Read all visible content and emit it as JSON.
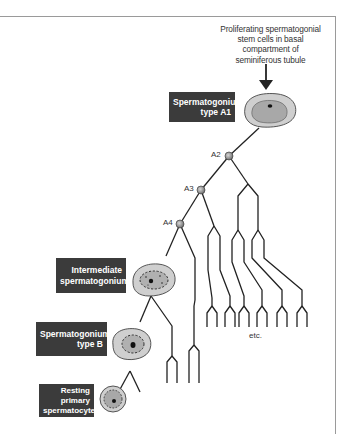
{
  "caption": {
    "lines": [
      "Proliferating spermatogonial",
      "stem cells in basal",
      "compartment of",
      "seminiferous tubule"
    ]
  },
  "labels": {
    "a1": [
      "Spermatogonium",
      "type A1"
    ],
    "intermediate": [
      "Intermediate",
      "spermatogonium"
    ],
    "type_b": [
      "Spermatogonium",
      "type B"
    ],
    "resting": [
      "Resting",
      "primary",
      "spermatocyte"
    ]
  },
  "nodes": {
    "a2": "A2",
    "a3": "A3",
    "a4": "A4"
  },
  "etc_label": "etc.",
  "colors": {
    "label_bg": "#3b3b3b",
    "label_text": "#ffffff",
    "cell_outer": "#c9c9c9",
    "cell_inner": "#a9a9a9",
    "line": "#222222",
    "node_fill": "#8c8c8c",
    "frame": "#9a9a9a"
  }
}
